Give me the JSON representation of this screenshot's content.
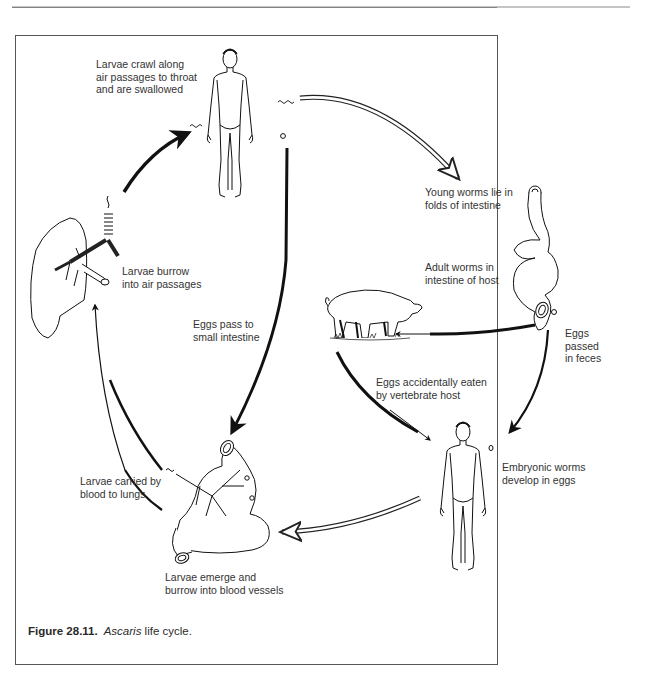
{
  "figure": {
    "number": "Figure 28.11.",
    "species": "Ascaris",
    "title_rest": " life cycle.",
    "colors": {
      "line": "#111111",
      "text": "#333333",
      "frame": "#555555",
      "background": "#ffffff"
    }
  },
  "labels": {
    "larvae_crawl": "Larvae crawl along\nair passages to throat\nand are swallowed",
    "young_worms": "Young worms lie in\nfolds of intestine",
    "larvae_burrow_air": "Larvae burrow\ninto air passages",
    "adult_worms": "Adult worms in\nintestine of host",
    "eggs_pass_small": "Eggs pass to\nsmall intestine",
    "eggs_feces": "Eggs\npassed\nin feces",
    "eggs_eaten": "Eggs accidentally eaten\nby vertebrate host",
    "embryonic": "Embryonic worms\ndevelop in eggs",
    "larvae_carried": "Larvae carried by\nblood to lungs",
    "larvae_emerge": "Larvae emerge and\nburrow into blood vessels"
  },
  "illustrations": [
    {
      "id": "human-top",
      "icon": "human-figure-icon"
    },
    {
      "id": "lungs",
      "icon": "lungs-icon"
    },
    {
      "id": "intestine-right",
      "icon": "intestine-icon"
    },
    {
      "id": "pig",
      "icon": "pig-icon"
    },
    {
      "id": "human-bottom",
      "icon": "human-figure-icon"
    },
    {
      "id": "intestine-bottom",
      "icon": "intestine-blood-vessels-icon"
    }
  ]
}
